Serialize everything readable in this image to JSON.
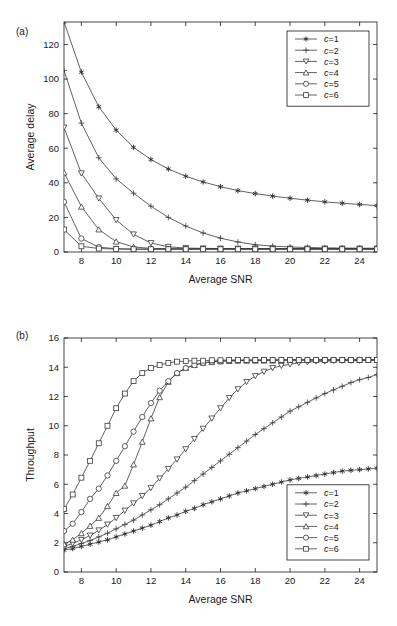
{
  "figure": {
    "panel_a_label": "(a)",
    "panel_b_label": "(b)"
  },
  "legend": {
    "entries": [
      {
        "label": "c=1",
        "marker": "asterisk"
      },
      {
        "label": "c=2",
        "marker": "plus"
      },
      {
        "label": "c=3",
        "marker": "triangle-down"
      },
      {
        "label": "c=4",
        "marker": "triangle-up"
      },
      {
        "label": "c=5",
        "marker": "circle"
      },
      {
        "label": "c=6",
        "marker": "square"
      }
    ]
  },
  "colors": {
    "line": "#3a3a3a",
    "axis": "#1a1a1a",
    "background": "#ffffff"
  },
  "chart_data": [
    {
      "type": "line",
      "panel": "(a)",
      "title": "",
      "xlabel": "Average SNR",
      "ylabel": "Average delay",
      "xlim": [
        7,
        25
      ],
      "ylim": [
        0,
        133
      ],
      "xticks": [
        8,
        10,
        12,
        14,
        16,
        18,
        20,
        22,
        24
      ],
      "yticks": [
        0,
        20,
        40,
        60,
        80,
        100,
        120
      ],
      "grid": false,
      "legend_position": "top-right",
      "x": [
        7,
        8,
        9,
        10,
        11,
        12,
        13,
        14,
        15,
        16,
        17,
        18,
        19,
        20,
        21,
        22,
        23,
        24,
        25
      ],
      "series": [
        {
          "name": "c=1",
          "marker": "asterisk",
          "values": [
            133,
            104,
            84,
            70.5,
            60.5,
            53.5,
            48,
            43.8,
            40.5,
            37.8,
            35.5,
            33.8,
            32.3,
            31.1,
            30.0,
            29.0,
            28.2,
            27.5,
            26.8
          ]
        },
        {
          "name": "c=2",
          "marker": "plus",
          "values": [
            105,
            74.5,
            54.5,
            42.3,
            34.0,
            26.5,
            20.0,
            15.0,
            11.0,
            8.0,
            5.8,
            4.2,
            3.4,
            2.9,
            2.6,
            2.4,
            2.3,
            2.2,
            2.2
          ]
        },
        {
          "name": "c=3",
          "marker": "triangle-down",
          "values": [
            72,
            45.5,
            31.0,
            18.5,
            10.2,
            5.2,
            3.0,
            2.3,
            2.1,
            2.0,
            2.0,
            2.0,
            2.0,
            2.0,
            2.0,
            2.0,
            2.0,
            2.0,
            2.0
          ]
        },
        {
          "name": "c=4",
          "marker": "triangle-up",
          "values": [
            46,
            26.2,
            13.0,
            6.0,
            2.9,
            2.1,
            1.9,
            1.9,
            1.9,
            1.9,
            1.9,
            1.9,
            1.9,
            1.9,
            1.9,
            1.9,
            1.9,
            1.9,
            1.9
          ]
        },
        {
          "name": "c=5",
          "marker": "circle",
          "values": [
            29,
            7.8,
            2.8,
            1.9,
            1.7,
            1.7,
            1.7,
            1.7,
            1.7,
            1.7,
            1.7,
            1.7,
            1.7,
            1.7,
            1.7,
            1.7,
            1.7,
            1.7,
            1.7
          ]
        },
        {
          "name": "c=6",
          "marker": "square",
          "values": [
            13,
            3.3,
            2.0,
            1.7,
            1.6,
            1.6,
            1.6,
            1.6,
            1.6,
            1.6,
            1.6,
            1.6,
            1.6,
            1.6,
            1.6,
            1.6,
            1.6,
            1.6,
            1.6
          ]
        }
      ]
    },
    {
      "type": "line",
      "panel": "(b)",
      "title": "",
      "xlabel": "Average SNR",
      "ylabel": "Throughput",
      "xlim": [
        7,
        25
      ],
      "ylim": [
        0,
        16
      ],
      "xticks": [
        8,
        10,
        12,
        14,
        16,
        18,
        20,
        22,
        24
      ],
      "yticks": [
        0,
        2,
        4,
        6,
        8,
        10,
        12,
        14,
        16
      ],
      "grid": false,
      "legend_position": "bottom-right",
      "x": [
        7,
        7.5,
        8,
        8.5,
        9,
        9.5,
        10,
        10.5,
        11,
        11.5,
        12,
        12.5,
        13,
        13.5,
        14,
        14.5,
        15,
        15.5,
        16,
        16.5,
        17,
        17.5,
        18,
        18.5,
        19,
        19.5,
        20,
        20.5,
        21,
        21.5,
        22,
        22.5,
        23,
        23.5,
        24,
        24.5,
        25
      ],
      "series": [
        {
          "name": "c=1",
          "marker": "asterisk",
          "values": [
            1.5,
            1.6,
            1.75,
            1.9,
            2.05,
            2.2,
            2.4,
            2.6,
            2.8,
            3.0,
            3.2,
            3.45,
            3.7,
            3.9,
            4.15,
            4.35,
            4.6,
            4.8,
            5.0,
            5.2,
            5.4,
            5.55,
            5.7,
            5.85,
            6.0,
            6.15,
            6.3,
            6.4,
            6.5,
            6.6,
            6.7,
            6.8,
            6.9,
            6.95,
            7.0,
            7.05,
            7.1
          ]
        },
        {
          "name": "c=2",
          "marker": "plus",
          "values": [
            1.6,
            1.75,
            1.95,
            2.15,
            2.4,
            2.65,
            2.95,
            3.25,
            3.55,
            3.9,
            4.25,
            4.6,
            5.0,
            5.4,
            5.8,
            6.25,
            6.7,
            7.15,
            7.6,
            8.05,
            8.5,
            8.95,
            9.4,
            9.8,
            10.2,
            10.6,
            11.0,
            11.3,
            11.6,
            11.9,
            12.2,
            12.45,
            12.7,
            12.95,
            13.15,
            13.3,
            13.5
          ]
        },
        {
          "name": "c=3",
          "marker": "triangle-down",
          "values": [
            1.75,
            1.95,
            2.2,
            2.5,
            2.85,
            3.25,
            3.7,
            4.2,
            4.7,
            5.2,
            5.75,
            6.4,
            7.05,
            7.7,
            8.4,
            9.1,
            9.8,
            10.5,
            11.2,
            11.9,
            12.5,
            13.0,
            13.4,
            13.7,
            13.95,
            14.1,
            14.2,
            14.3,
            14.35,
            14.4,
            14.4,
            14.45,
            14.45,
            14.45,
            14.45,
            14.5,
            14.5
          ]
        },
        {
          "name": "c=4",
          "marker": "triangle-up",
          "values": [
            1.9,
            2.2,
            2.65,
            3.15,
            3.7,
            4.5,
            5.4,
            5.9,
            7.35,
            8.9,
            10.5,
            11.95,
            13.0,
            13.6,
            13.95,
            14.15,
            14.3,
            14.35,
            14.4,
            14.42,
            14.45,
            14.45,
            14.45,
            14.45,
            14.45,
            14.5,
            14.5,
            14.5,
            14.5,
            14.5,
            14.5,
            14.5,
            14.5,
            14.5,
            14.5,
            14.5,
            14.5
          ]
        },
        {
          "name": "c=5",
          "marker": "circle",
          "values": [
            2.8,
            3.3,
            4.1,
            5.0,
            5.7,
            6.6,
            7.6,
            8.6,
            9.6,
            10.6,
            11.55,
            12.4,
            13.05,
            13.6,
            13.95,
            14.15,
            14.3,
            14.38,
            14.42,
            14.45,
            14.45,
            14.48,
            14.48,
            14.5,
            14.5,
            14.5,
            14.5,
            14.5,
            14.5,
            14.5,
            14.5,
            14.5,
            14.5,
            14.5,
            14.5,
            14.5,
            14.5
          ]
        },
        {
          "name": "c=6",
          "marker": "square",
          "values": [
            4.3,
            5.3,
            6.45,
            7.6,
            8.8,
            10.0,
            11.2,
            12.2,
            13.05,
            13.6,
            13.95,
            14.15,
            14.3,
            14.38,
            14.42,
            14.45,
            14.45,
            14.48,
            14.48,
            14.5,
            14.5,
            14.5,
            14.5,
            14.5,
            14.5,
            14.5,
            14.5,
            14.5,
            14.5,
            14.5,
            14.5,
            14.5,
            14.5,
            14.5,
            14.5,
            14.5,
            14.5
          ]
        }
      ]
    }
  ]
}
